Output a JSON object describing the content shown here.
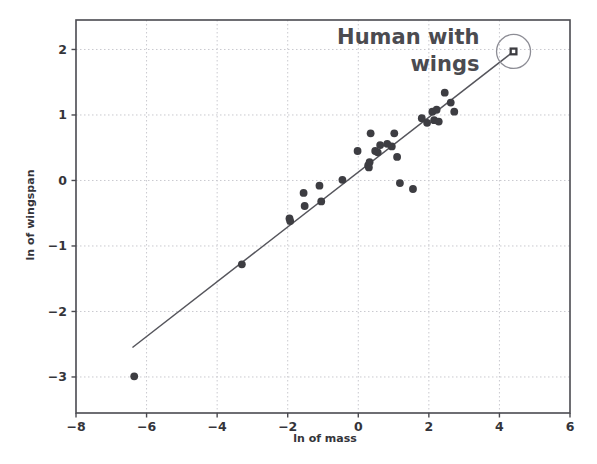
{
  "chart_data": {
    "type": "scatter",
    "title": "",
    "xlabel": "ln of mass",
    "ylabel": "ln of wingspan",
    "xlim": [
      -8,
      6
    ],
    "ylim": [
      -3.55,
      2.45
    ],
    "xticks": [
      -8,
      -6,
      -4,
      -2,
      0,
      2,
      4,
      6
    ],
    "xtick_labels": [
      "−8",
      "−6",
      "−4",
      "−2",
      "0",
      "2",
      "4",
      "6"
    ],
    "yticks": [
      -3,
      -2,
      -1,
      0,
      1,
      2
    ],
    "ytick_labels": [
      "−3",
      "−2",
      "−1",
      "0",
      "1",
      "2"
    ],
    "grid": true,
    "grid_style": "dotted",
    "legend": "none",
    "series": [
      {
        "name": "birds",
        "marker": "circle",
        "color": "#3d3d42",
        "points": [
          [
            -6.35,
            -2.99
          ],
          [
            -3.3,
            -1.28
          ],
          [
            -1.95,
            -0.58
          ],
          [
            -1.93,
            -0.62
          ],
          [
            -1.55,
            -0.19
          ],
          [
            -1.52,
            -0.39
          ],
          [
            -1.1,
            -0.08
          ],
          [
            -1.05,
            -0.32
          ],
          [
            -0.45,
            0.01
          ],
          [
            -0.02,
            0.45
          ],
          [
            0.28,
            0.23
          ],
          [
            0.3,
            0.2
          ],
          [
            0.32,
            0.28
          ],
          [
            0.35,
            0.72
          ],
          [
            0.48,
            0.45
          ],
          [
            0.55,
            0.43
          ],
          [
            0.62,
            0.54
          ],
          [
            0.82,
            0.56
          ],
          [
            0.95,
            0.52
          ],
          [
            1.02,
            0.72
          ],
          [
            1.1,
            0.36
          ],
          [
            1.18,
            -0.04
          ],
          [
            1.55,
            -0.13
          ],
          [
            1.8,
            0.95
          ],
          [
            1.95,
            0.88
          ],
          [
            2.1,
            1.05
          ],
          [
            2.15,
            0.92
          ],
          [
            2.22,
            1.08
          ],
          [
            2.28,
            0.9
          ],
          [
            2.45,
            1.34
          ],
          [
            2.62,
            1.19
          ],
          [
            2.72,
            1.05
          ]
        ]
      },
      {
        "name": "Human with wings",
        "marker": "square",
        "color": "#3d3d42",
        "points": [
          [
            4.4,
            1.97
          ]
        ]
      }
    ],
    "trendline": {
      "name": "regression line",
      "color": "#55555c",
      "x_start": -6.4,
      "y_start": -2.55,
      "x_end": 4.4,
      "y_end": 1.97
    },
    "annotations": [
      {
        "name": "human-with-wings",
        "lines": [
          "Human with",
          "wings"
        ],
        "text": "Human with wings",
        "target_x": 4.4,
        "target_y": 1.97,
        "highlight": "circle"
      }
    ],
    "colors": {
      "marker": "#3d3d42",
      "line": "#55555c",
      "grid": "#c9c9cf",
      "axis": "#4a4a50",
      "annotation_text": "#4b4b50",
      "background": "#ffffff"
    }
  }
}
